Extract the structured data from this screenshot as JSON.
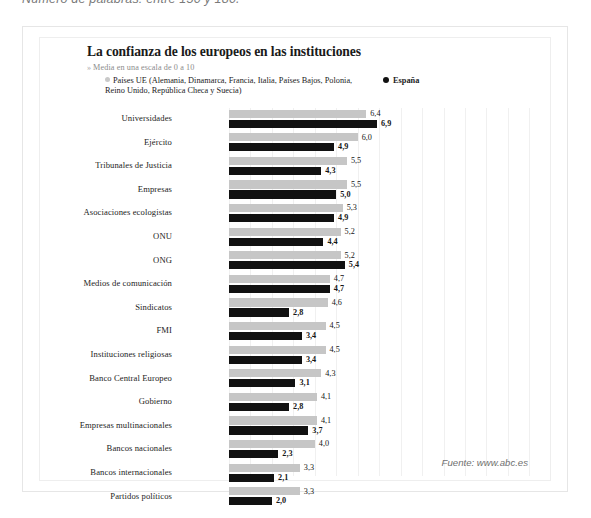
{
  "top_caption": "Número de palabras: entre 150 y 180.",
  "chart_header": {
    "title": "La confianza de los europeos en las instituciones",
    "subtitle_bullet": "»",
    "subtitle": "Media en una escala de 0 a 10"
  },
  "legend": {
    "eu_marker": "eu-dot-icon",
    "eu_label": "Países UE (Alemania, Dinamarca, Francia, Italia, Países Bajos, Polonia, Reino Unido, República Checa y Suecia)",
    "es_marker": "spain-dot-icon",
    "es_label": "España"
  },
  "source": "Fuente: www.abc.es",
  "chart_data": {
    "type": "bar",
    "orientation": "horizontal",
    "title": "La confianza de los europeos en las instituciones",
    "subtitle": "Media en una escala de 0 a 10",
    "xlabel": "",
    "ylabel": "",
    "xlim": [
      0,
      10
    ],
    "grid": true,
    "grid_axis": "x",
    "legend_position": "top",
    "value_format": "comma-decimal",
    "categories": [
      "Universidades",
      "Ejército",
      "Tribunales de Justicia",
      "Empresas",
      "Asociaciones ecologistas",
      "ONU",
      "ONG",
      "Medios de comunicación",
      "Sindicatos",
      "FMI",
      "Instituciones religiosas",
      "Banco Central Europeo",
      "Gobierno",
      "Empresas multinacionales",
      "Bancos nacionales",
      "Bancos internacionales",
      "Partidos políticos"
    ],
    "series": [
      {
        "name": "Países UE (Alemania, Dinamarca, Francia, Italia, Países Bajos, Polonia, Reino Unido, República Checa y Suecia)",
        "color": "#c6c6c6",
        "values": [
          6.4,
          6.0,
          5.5,
          5.5,
          5.3,
          5.2,
          5.2,
          4.7,
          4.6,
          4.5,
          4.5,
          4.3,
          4.1,
          4.1,
          4.0,
          3.3,
          3.3
        ],
        "labels": [
          "6,4",
          "6,0",
          "5,5",
          "5,5",
          "5,3",
          "5,2",
          "5,2",
          "4,7",
          "4,6",
          "4,5",
          "4,5",
          "4,3",
          "4,1",
          "4,1",
          "4,0",
          "3,3",
          "3,3"
        ]
      },
      {
        "name": "España",
        "color": "#111111",
        "values": [
          6.9,
          4.9,
          4.3,
          5.0,
          4.9,
          4.4,
          5.4,
          4.7,
          2.8,
          3.4,
          3.4,
          3.1,
          2.8,
          3.7,
          2.3,
          2.1,
          2.0
        ],
        "labels": [
          "6,9",
          "4,9",
          "4,3",
          "5,0",
          "4,9",
          "4,4",
          "5,4",
          "4,7",
          "2,8",
          "3,4",
          "3,4",
          "3,1",
          "2,8",
          "3,7",
          "2,3",
          "2,1",
          "2,0"
        ]
      }
    ]
  }
}
